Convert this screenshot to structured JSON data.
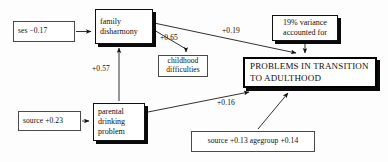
{
  "diagram": {
    "type": "path-diagram",
    "title": "",
    "nodes": [
      {
        "id": "ses",
        "style": "plain",
        "lines": [
          "ses −0.17"
        ],
        "x": 13,
        "y": 21,
        "w": 62,
        "h": 21
      },
      {
        "id": "family_disharmony",
        "style": "shadow",
        "lines": [
          "family",
          "disharmony"
        ],
        "x": 95,
        "y": 9,
        "w": 58,
        "h": 35
      },
      {
        "id": "childhood_difficulties",
        "style": "plain",
        "lines": [
          "childhood",
          "difficulties"
        ],
        "x": 158,
        "y": 55,
        "w": 50,
        "h": 22
      },
      {
        "id": "variance_accounted",
        "style": "shadow",
        "lines": [
          "19% variance",
          "accounted for"
        ],
        "x": 272,
        "y": 15,
        "w": 66,
        "h": 26
      },
      {
        "id": "problems_transition",
        "style": "heavy",
        "lines": [
          "PROBLEMS IN TRANSITION",
          "TO ADULTHOOD"
        ],
        "x": 243,
        "y": 57,
        "w": 134,
        "h": 31
      },
      {
        "id": "source_023",
        "style": "plain",
        "lines": [
          "source +0.23"
        ],
        "x": 18,
        "y": 111,
        "w": 63,
        "h": 20
      },
      {
        "id": "parental_drinking",
        "style": "shadow",
        "lines": [
          "parental",
          "drinking",
          "problem"
        ],
        "x": 93,
        "y": 103,
        "w": 52,
        "h": 38
      },
      {
        "id": "source_agegroup",
        "style": "plain",
        "lines": [
          "source +0.13   agegroup +0.14"
        ],
        "x": 191,
        "y": 131,
        "w": 124,
        "h": 21
      }
    ],
    "edges": [
      {
        "id": "ses-to-family",
        "from": "ses",
        "to": "family_disharmony",
        "label": ""
      },
      {
        "id": "family-to-childhood",
        "from": "family_disharmony",
        "to": "childhood_difficulties",
        "label": "+0.65"
      },
      {
        "id": "family-to-problems",
        "from": "family_disharmony",
        "to": "problems_transition",
        "label": "+0.19"
      },
      {
        "id": "drinking-to-family",
        "from": "parental_drinking",
        "to": "family_disharmony",
        "label": "+0.57"
      },
      {
        "id": "source023-to-drinking",
        "from": "source_023",
        "to": "parental_drinking",
        "label": ""
      },
      {
        "id": "drinking-to-problems",
        "from": "parental_drinking",
        "to": "problems_transition",
        "label": "+0.16"
      },
      {
        "id": "sourceage-to-problems",
        "from": "source_agegroup",
        "to": "problems_transition",
        "label": ""
      },
      {
        "id": "variance-to-problems",
        "from": "variance_accounted",
        "to": "problems_transition",
        "label": ""
      }
    ],
    "edge_labels": [
      {
        "id": "label-065",
        "text": "+0.65",
        "x": 160,
        "y": 33
      },
      {
        "id": "label-019",
        "text": "+0.19",
        "x": 222,
        "y": 26
      },
      {
        "id": "label-057",
        "text": "+0.57",
        "x": 92,
        "y": 64
      },
      {
        "id": "label-016",
        "text": "+0.16",
        "x": 217,
        "y": 98
      }
    ],
    "colors": {
      "background": "#fdfdfd",
      "stroke": "#1a1a1a",
      "text": "#0d0d0d",
      "shadow": "#0a0a0a"
    }
  }
}
